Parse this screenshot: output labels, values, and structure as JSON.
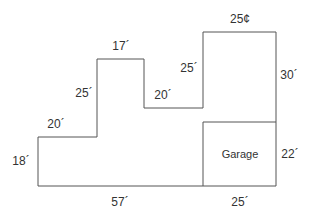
{
  "diagram": {
    "type": "floor-plan-outline",
    "stroke_color": "#555555",
    "text_color": "#333333",
    "room": {
      "label": "Garage"
    },
    "dimensions": [
      {
        "id": "top-right",
        "label": "25¢",
        "x": 240,
        "y": 23
      },
      {
        "id": "upper-step-top",
        "label": "17´",
        "x": 121,
        "y": 50
      },
      {
        "id": "upper-step-left",
        "label": "25´",
        "x": 84,
        "y": 97
      },
      {
        "id": "mid-step-right",
        "label": "25´",
        "x": 189,
        "y": 72
      },
      {
        "id": "middle-ledge",
        "label": "20´",
        "x": 163,
        "y": 99
      },
      {
        "id": "right-wall",
        "label": "30´",
        "x": 289,
        "y": 79
      },
      {
        "id": "lower-ledge",
        "label": "20´",
        "x": 56,
        "y": 128
      },
      {
        "id": "left-wall",
        "label": "18´",
        "x": 21,
        "y": 165
      },
      {
        "id": "garage-side",
        "label": "22´",
        "x": 290,
        "y": 158
      },
      {
        "id": "bottom-left",
        "label": "57´",
        "x": 120,
        "y": 206
      },
      {
        "id": "bottom-garage",
        "label": "25´",
        "x": 240,
        "y": 206
      }
    ]
  }
}
